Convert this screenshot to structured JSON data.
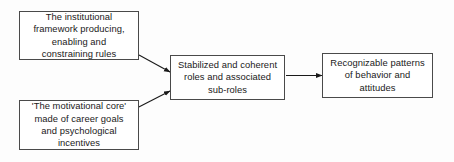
{
  "diagram": {
    "type": "flow-diagram",
    "background_color": "#fdfdfd",
    "box_border_color": "#4a4a4a",
    "text_color": "#1a1a1a",
    "connector_color": "#1a1a1a",
    "nodes": [
      {
        "id": "institutional-framework",
        "text": "The institutional\nframework producing,\nenabling and\nconstraining rules"
      },
      {
        "id": "motivational-core",
        "text": "'The motivational core'\nmade of career goals\nand psychological\nincentives"
      },
      {
        "id": "stabilized-roles",
        "text": "Stabilized and coherent\nroles and associated\nsub-roles"
      },
      {
        "id": "recognizable-patterns",
        "text": "Recognizable patterns\nof behavior and\nattitudes"
      }
    ],
    "connectors": [
      {
        "id": "framework-to-roles",
        "from": "institutional-framework",
        "to": "stabilized-roles",
        "style": "diagonal-down-right-arrow"
      },
      {
        "id": "motivational-to-roles",
        "from": "motivational-core",
        "to": "stabilized-roles",
        "style": "diagonal-up-right-arrow"
      },
      {
        "id": "roles-to-patterns",
        "from": "stabilized-roles",
        "to": "recognizable-patterns",
        "style": "horizontal-right-arrow"
      }
    ]
  }
}
